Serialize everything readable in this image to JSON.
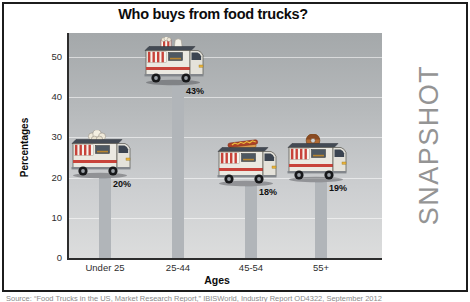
{
  "figure": {
    "side_label": "SNAPSHOT",
    "source_line": "Source: “Food Trucks in the US, Market Research Report,” IBISWorld, Industry Report OD4322, September 2012"
  },
  "chart_data": {
    "type": "bar",
    "title": "Who buys from food trucks?",
    "xlabel": "Ages",
    "ylabel": "Percentages",
    "categories": [
      "Under 25",
      "25-44",
      "45-54",
      "55+"
    ],
    "values": [
      20,
      43,
      18,
      19
    ],
    "value_labels": [
      "20%",
      "43%",
      "18%",
      "19%"
    ],
    "bar_icons": [
      "popcorn",
      "popcorn-box",
      "hotdog",
      "donut"
    ],
    "yticks": [
      0,
      10,
      20,
      30,
      40,
      50
    ],
    "ylim": [
      0,
      56
    ],
    "grid": true,
    "legend": "none",
    "colors": {
      "bar": "#b1b5b9",
      "plot_bg_top": "#a4a8aa",
      "plot_bg_bottom": "#dcdddd",
      "accent_red": "#c8433a",
      "side_label_gray": "#949494"
    }
  }
}
